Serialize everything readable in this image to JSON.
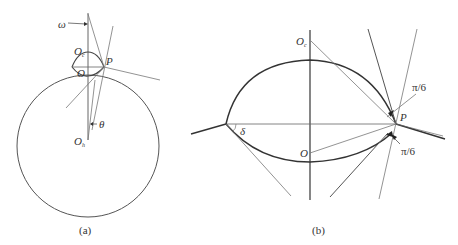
{
  "panel_a": {
    "caption": "(a)",
    "labels": {
      "omega": "ω",
      "Oc": "O",
      "Oc_sub": "c",
      "O": "O",
      "P": "P",
      "theta": "θ",
      "Oh": "O",
      "Oh_sub": "h"
    }
  },
  "panel_b": {
    "caption": "(b)",
    "labels": {
      "Oc": "O",
      "Oc_sub": "c",
      "O": "O",
      "P": "P",
      "delta": "δ",
      "angle_top": "π/6",
      "angle_bottom": "π/6"
    }
  },
  "colors": {
    "stroke_main": "#444444",
    "stroke_thin": "#888888",
    "text": "#333333"
  }
}
